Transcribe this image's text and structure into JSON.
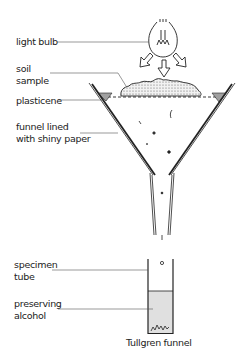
{
  "diagram": {
    "title": "Tullgren funnel",
    "labels": {
      "light_bulb": "light bulb",
      "soil_sample_1": "soil",
      "soil_sample_2": "sample",
      "plasticene": "plasticene",
      "funnel_1": "funnel lined",
      "funnel_2": "with shiny paper",
      "specimen_1": "specimen",
      "specimen_2": "tube",
      "alcohol_1": "preserving",
      "alcohol_2": "alcohol"
    },
    "colors": {
      "line": "#222222",
      "soil": "#d9d9d9",
      "plasticene": "#a0a0a0",
      "alcohol": "#e0e0e0"
    }
  }
}
